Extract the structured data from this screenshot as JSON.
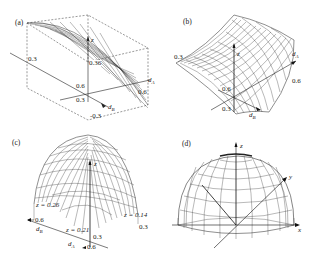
{
  "panels": [
    {
      "id": "a",
      "label": "(a)",
      "axes": {
        "vertical": "z",
        "depth": "d_B",
        "horizontal": "d_A"
      },
      "ticks": {
        "left": "0.3",
        "center_top": "0.36",
        "center": "0.6",
        "center_low": "0.3",
        "right": "0.6",
        "bottom": "-0.3"
      }
    },
    {
      "id": "b",
      "label": "(b)",
      "axes": {
        "vertical": "z",
        "depth": "d_B",
        "horizontal": "d_A"
      },
      "ticks": {
        "left": "0.3",
        "right": "0.6",
        "center": "0.6",
        "bottom": "0.3"
      }
    },
    {
      "id": "c",
      "label": "(c)",
      "axes": {
        "vertical": "z",
        "left": "d_B",
        "bottom": "d_A"
      },
      "ticks": {
        "left": "0.6",
        "right": "0.3",
        "center": "0.3",
        "bottom": "0.6"
      },
      "annotations": [
        "z = 0.26",
        "z = 0.21",
        "z = 0.14"
      ]
    },
    {
      "id": "d",
      "label": "(d)",
      "axes": {
        "vertical": "z",
        "right_up": "y",
        "right": "x"
      }
    }
  ]
}
